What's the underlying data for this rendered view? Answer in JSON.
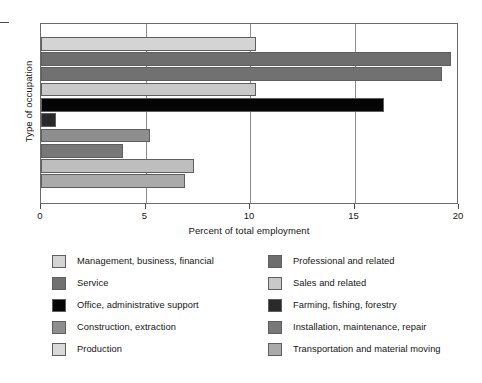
{
  "chart_data": {
    "type": "bar",
    "orientation": "horizontal",
    "title": "",
    "xlabel": "Percent of total employment",
    "ylabel": "Type of occupation",
    "xlim": [
      0,
      20
    ],
    "xticks": [
      0,
      5,
      10,
      15,
      20
    ],
    "xticklabels": [
      "0",
      "5",
      "10",
      "15",
      "20"
    ],
    "gridlines": [
      5,
      10,
      15
    ],
    "grid": true,
    "legend_position": "below-plot",
    "legend_columns": 2,
    "categories": [
      "Management, business, financial",
      "Professional and related",
      "Service",
      "Sales and related",
      "Office, administrative support",
      "Farming, fishing, forestry",
      "Construction, extraction",
      "Installation, maintenance, repair",
      "Production",
      "Transportation and material moving"
    ],
    "values": [
      10.3,
      19.6,
      19.2,
      10.3,
      16.4,
      0.7,
      5.2,
      3.9,
      7.3,
      6.9
    ],
    "colors": [
      "#d4d4d4",
      "#6e6e6e",
      "#717171",
      "#c9c9c9",
      "#050505",
      "#2a2a2a",
      "#8e8e8e",
      "#787878",
      "#bebebe",
      "#aaaaaa"
    ]
  },
  "axis": {
    "ylabel": "Type of occupation",
    "xlabel": "Percent of total employment",
    "ticklabels": [
      "0",
      "5",
      "10",
      "15",
      "20"
    ]
  },
  "legend": {
    "left_column": [
      {
        "label": "Management, business, financial",
        "color": "#d4d4d4"
      },
      {
        "label": "Service",
        "color": "#717171"
      },
      {
        "label": "Office, administrative support",
        "color": "#050505"
      },
      {
        "label": "Construction, extraction",
        "color": "#8e8e8e"
      },
      {
        "label": "Production",
        "color": "#d9d9d9"
      }
    ],
    "right_column": [
      {
        "label": "Professional and related",
        "color": "#6e6e6e"
      },
      {
        "label": "Sales and related",
        "color": "#c9c9c9"
      },
      {
        "label": "Farming, fishing, forestry",
        "color": "#2a2a2a"
      },
      {
        "label": "Installation, maintenance, repair",
        "color": "#787878"
      },
      {
        "label": "Transportation and material moving",
        "color": "#aaaaaa"
      }
    ]
  }
}
